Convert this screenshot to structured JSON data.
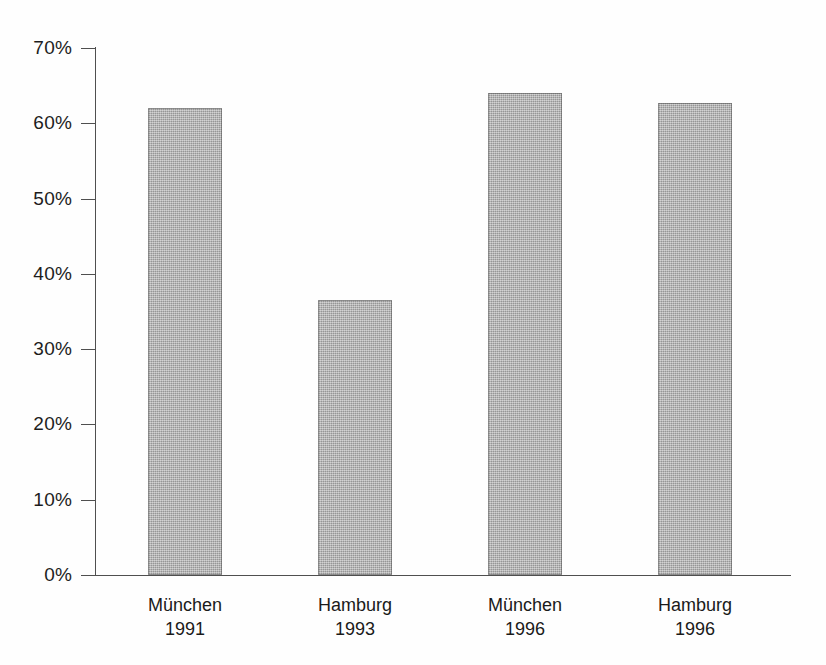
{
  "chart_data": {
    "type": "bar",
    "title": "",
    "subtitle": "",
    "xlabel": "",
    "ylabel": "",
    "categories": [
      "München\n1991",
      "Hamburg\n1993",
      "München\n1996",
      "Hamburg\n1996"
    ],
    "category_parts": [
      {
        "city": "München",
        "year": "1991"
      },
      {
        "city": "Hamburg",
        "year": "1993"
      },
      {
        "city": "München",
        "year": "1996"
      },
      {
        "city": "Hamburg",
        "year": "1996"
      }
    ],
    "values": [
      62,
      36.5,
      64,
      62.7
    ],
    "value_unit": "%",
    "ylim": [
      0,
      70
    ],
    "y_tick_step": 10,
    "y_ticks": [
      70,
      60,
      50,
      40,
      30,
      20,
      10,
      0
    ],
    "y_tick_labels": [
      "70%",
      "60%",
      "50%",
      "40%",
      "30%",
      "20%",
      "10%",
      "0%"
    ],
    "grid": false,
    "legend": false,
    "legend_position": "none",
    "bar_color": "#a9a9a9",
    "bar_edge_color": "#5a5a5a",
    "axis_color": "#4f4f4f",
    "background_color": "#fefefe",
    "text_color": "#1a1a1a"
  }
}
